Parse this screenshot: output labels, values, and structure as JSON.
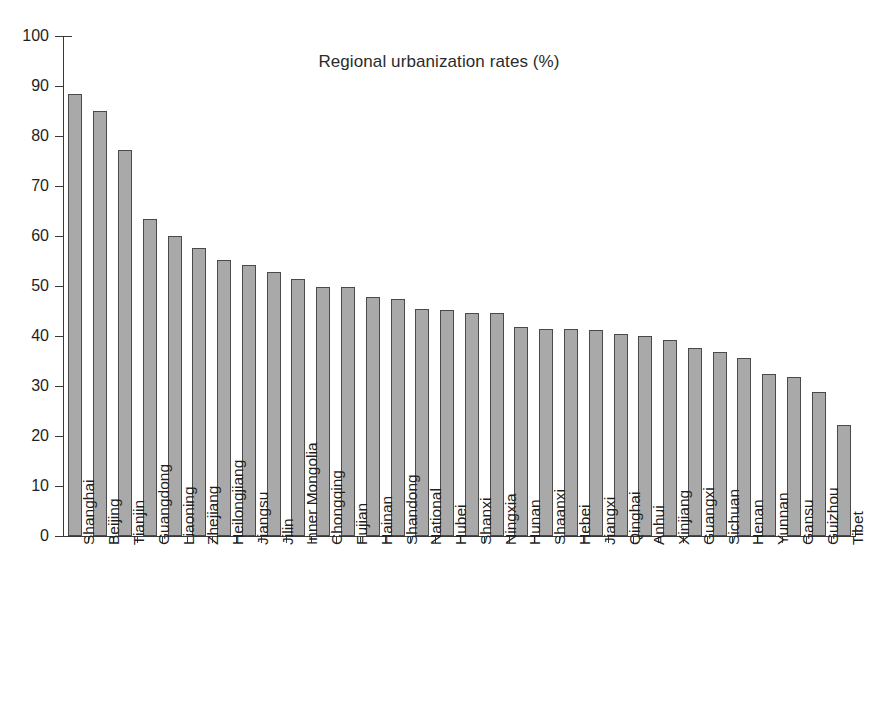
{
  "chart_data": {
    "type": "bar",
    "title": "Regional urbanization rates (%)",
    "xlabel": "",
    "ylabel": "",
    "ylim": [
      0,
      100
    ],
    "ytick_step": 10,
    "yticks": [
      0,
      10,
      20,
      30,
      40,
      50,
      60,
      70,
      80,
      90,
      100
    ],
    "grid": false,
    "legend": "none",
    "orientation": "vertical",
    "bar_color": "#a9a9a9",
    "bar_edge_color": "#4a4a4a",
    "axis_color": "#3a3a3a",
    "background": "#ffffff",
    "sorted": "descending",
    "categories": [
      "Shanghai",
      "Beijing",
      "Tianjin",
      "Guangdong",
      "Liaoning",
      "Zhejiang",
      "Heilongjiang",
      "Jiangsu",
      "Jilin",
      "Inner Mongolia",
      "Chongqing",
      "Fujian",
      "Hainan",
      "Shandong",
      "National",
      "Hubei",
      "Shanxi",
      "Ningxia",
      "Hunan",
      "Shaanxi",
      "Hebei",
      "Jiangxi",
      "Qinghai",
      "Anhui",
      "Xinjiang",
      "Guangxi",
      "Sichuan",
      "Henan",
      "Yunnan",
      "Gansu",
      "Guizhou",
      "Tibet"
    ],
    "values": [
      88.4,
      85.0,
      77.3,
      63.4,
      60.0,
      57.6,
      55.3,
      54.3,
      52.9,
      51.4,
      49.9,
      49.9,
      47.9,
      47.4,
      45.5,
      45.2,
      44.7,
      44.7,
      41.9,
      41.5,
      41.5,
      41.2,
      40.4,
      40.0,
      39.2,
      37.6,
      36.8,
      35.7,
      32.5,
      31.9,
      28.8,
      22.2
    ]
  }
}
